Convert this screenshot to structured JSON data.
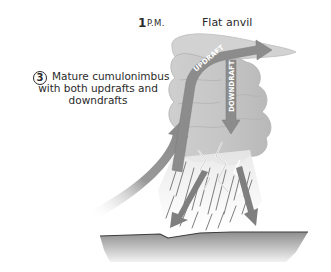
{
  "diagram": {
    "time": {
      "hour": "1",
      "unit": "P.M."
    },
    "anvil_label": "Flat anvil",
    "stage": {
      "number": "3",
      "description_lines": [
        "Mature cumulonimbus",
        "with both updrafts and",
        "downdrafts"
      ]
    },
    "arrows": {
      "updraft_label": "UPDRAFT",
      "downdraft_label": "DOWNDRAFT"
    },
    "colors": {
      "cloud": "#c8c8c8",
      "cloud_shadow": "#a9a9a9",
      "arrow": "#8a8a8a",
      "ground": "#9a9a9a",
      "text": "#2a2a2a"
    }
  }
}
